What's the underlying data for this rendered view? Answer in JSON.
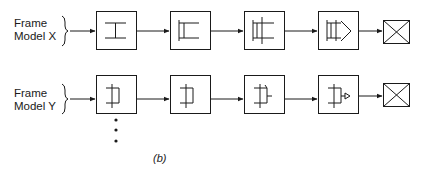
{
  "rows": [
    {
      "label_line1": "Frame",
      "label_line2": "Model X",
      "stages": [
        "I-beam frame",
        "frame with upright",
        "frame with crossbars",
        "frame with nose cone",
        "completed crate"
      ]
    },
    {
      "label_line1": "Frame",
      "label_line2": "Model Y",
      "stages": [
        "Y frame",
        "Y frame with upright",
        "Y frame with bar",
        "Y frame with nozzle",
        "completed crate"
      ]
    }
  ],
  "continuation": "more models",
  "caption": "(b)",
  "colors": {
    "stroke": "#1a1a1a",
    "background": "#ffffff"
  }
}
